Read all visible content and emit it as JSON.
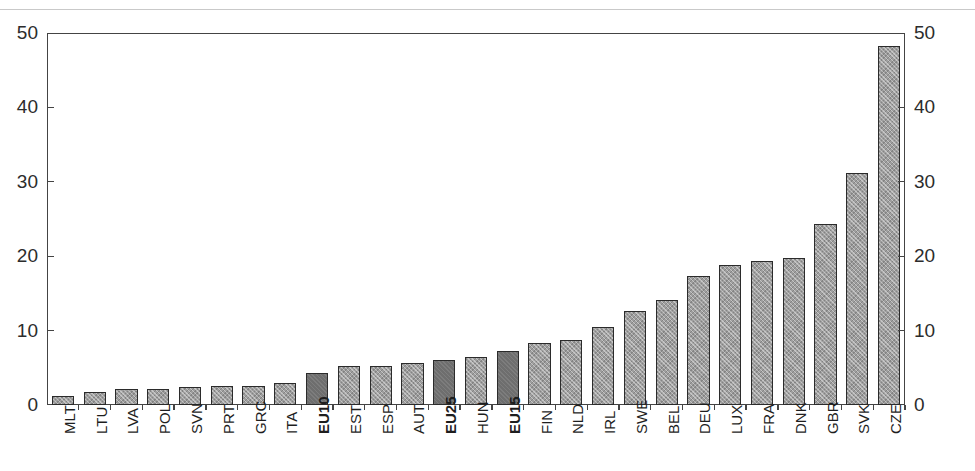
{
  "figure": {
    "background_color": "#ffffff",
    "axis_color": "#444444"
  },
  "axes": {
    "y_left_label": "",
    "y_right_label": "",
    "x_label": "",
    "y_ticks": [
      "0",
      "10",
      "20",
      "30",
      "40",
      "50"
    ],
    "y_min": 0,
    "y_max": 50
  },
  "colors": {
    "bar_normal": "#9e9e9e",
    "bar_highlight": "#6e6e6e",
    "bar_border": "#2b2b2b",
    "text": "#1e1e1e"
  },
  "chart_data": {
    "type": "bar",
    "title": "",
    "xlabel": "",
    "ylabel": "",
    "ylim": [
      0,
      50
    ],
    "grid": false,
    "legend": "none",
    "categories": [
      "MLT",
      "LTU",
      "LVA",
      "POL",
      "SVN",
      "PRT",
      "GRC",
      "ITA",
      "EU10",
      "EST",
      "ESP",
      "AUT",
      "EU25",
      "HUN",
      "EU15",
      "FIN",
      "NLD",
      "IRL",
      "SWE",
      "BEL",
      "DEU",
      "LUX",
      "FRA",
      "DNK",
      "GBR",
      "SVK",
      "CZE"
    ],
    "values": [
      1.2,
      1.7,
      2.1,
      2.1,
      2.4,
      2.5,
      2.5,
      3.0,
      4.3,
      5.3,
      5.3,
      5.7,
      6.1,
      6.4,
      7.2,
      8.3,
      8.8,
      10.5,
      12.6,
      14.1,
      17.3,
      18.8,
      19.3,
      19.7,
      24.3,
      31.2,
      48.3
    ],
    "highlighted": [
      "EU10",
      "EU25",
      "EU15"
    ],
    "bold_labels": [
      "EU10",
      "EU25",
      "EU15"
    ]
  }
}
